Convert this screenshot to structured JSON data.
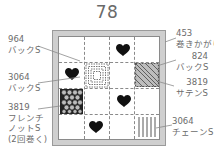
{
  "title": "78",
  "labels": {
    "tl": {
      "num": "964",
      "name": "バックS"
    },
    "ml": {
      "num": "3064",
      "name": "バックS"
    },
    "bl": {
      "num": "3819",
      "line1": "フレンチ",
      "line2": "ノットS",
      "line3": "(2回巻く)"
    },
    "tr": {
      "num": "453",
      "name": "巻きかがり"
    },
    "mr1": {
      "num": "824",
      "name": "バックS"
    },
    "mr2": {
      "num": "3819",
      "name": "サテンS"
    },
    "br": {
      "num": "3064",
      "name": "チェーンS"
    }
  },
  "grid": {
    "rows": 4,
    "cols": 4
  },
  "hearts": [
    {
      "row": 0,
      "col": 2
    },
    {
      "row": 1,
      "col": 0
    },
    {
      "row": 2,
      "col": 2
    },
    {
      "row": 3,
      "col": 1
    }
  ],
  "colors": {
    "frame": "#cfcfcf",
    "heart": "#111111",
    "line": "#8a8a8a",
    "text": "#6b6b6b"
  }
}
